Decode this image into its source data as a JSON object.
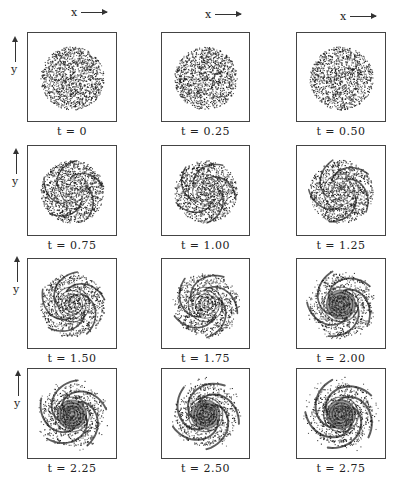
{
  "figure": {
    "x_axis_label": "x",
    "y_axis_label": "y",
    "panels": [
      {
        "label": "t = 0",
        "t": 0,
        "stage": 0
      },
      {
        "label": "t = 0.25",
        "t": 0.25,
        "stage": 1
      },
      {
        "label": "t = 0.50",
        "t": 0.5,
        "stage": 2
      },
      {
        "label": "t = 0.75",
        "t": 0.75,
        "stage": 3
      },
      {
        "label": "t = 1.00",
        "t": 1.0,
        "stage": 4
      },
      {
        "label": "t = 1.25",
        "t": 1.25,
        "stage": 5
      },
      {
        "label": "t = 1.50",
        "t": 1.5,
        "stage": 6
      },
      {
        "label": "t = 1.75",
        "t": 1.75,
        "stage": 7
      },
      {
        "label": "t = 2.00",
        "t": 2.0,
        "stage": 8
      },
      {
        "label": "t = 2.25",
        "t": 2.25,
        "stage": 9
      },
      {
        "label": "t = 2.50",
        "t": 2.5,
        "stage": 10
      },
      {
        "label": "t = 2.75",
        "t": 2.75,
        "stage": 11
      }
    ],
    "colors": {
      "ink": "#1a1a1a",
      "frame": "#444444",
      "background": "#ffffff"
    }
  }
}
